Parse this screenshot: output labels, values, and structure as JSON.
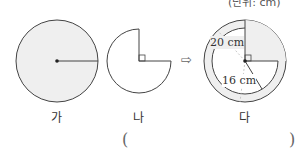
{
  "header": {
    "unit_note": "(단위: cm)"
  },
  "figures": [
    {
      "id": "ga",
      "label": "가"
    },
    {
      "id": "na",
      "label": "나"
    },
    {
      "id": "da",
      "label": "다"
    }
  ],
  "arrow": "⇨",
  "measurements": {
    "outer": "20 cm",
    "inner": "16 cm"
  },
  "answer": {
    "open": "(",
    "close": ")"
  },
  "colors": {
    "fill": "#efefef",
    "stroke": "#444444"
  }
}
